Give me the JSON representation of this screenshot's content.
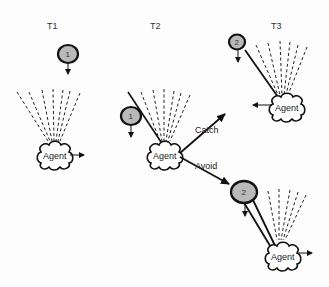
{
  "panels": {
    "t1": {
      "label": "T1",
      "ball_number": "1",
      "agent_label": "Agent"
    },
    "t2": {
      "label": "T2",
      "ball_number": "1",
      "agent_label": "Agent"
    },
    "t3_catch": {
      "label": "T3",
      "ball_number": "2",
      "agent_label": "Agent"
    },
    "t3_avoid": {
      "ball_number": "2",
      "agent_label": "Agent"
    }
  },
  "transitions": {
    "catch_label": "Catch",
    "avoid_label": "Avoid"
  },
  "colors": {
    "ball_fill": "#b9b9b9",
    "stroke": "#111111",
    "cloud_fill": "#ffffff"
  }
}
